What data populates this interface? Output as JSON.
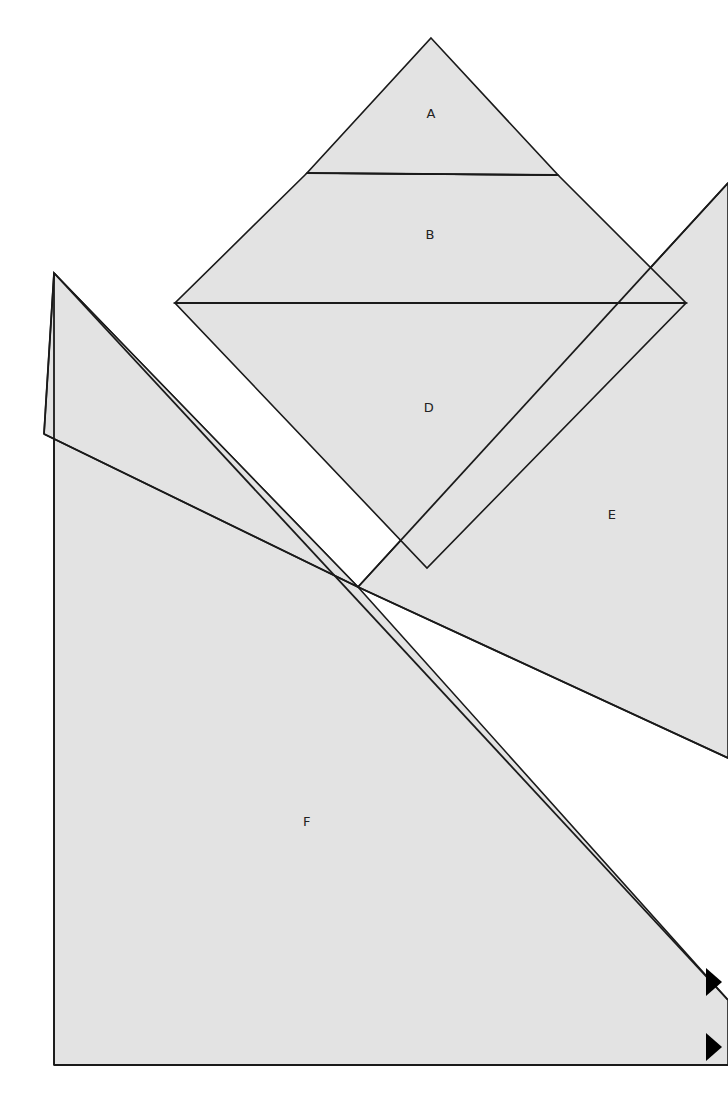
{
  "figure": {
    "canvas": {
      "width": 728,
      "height": 1119
    },
    "style": {
      "background_color": "#ffffff",
      "fill_color": "#e3e3e3",
      "stroke_color": "#1a1a1a",
      "marker_color": "#000000",
      "label_color": "#222222",
      "stroke_width": 1.6
    }
  },
  "regions": [
    {
      "id": "A",
      "label": "A",
      "label_x": 431,
      "label_y": 114,
      "description": "upper triangular cap of the large diamond",
      "points": "431,38 558,175 307,173"
    },
    {
      "id": "B",
      "label": "B",
      "label_x": 430,
      "label_y": 235,
      "description": "middle band of the large diamond",
      "points": "307,173 558,175 686,303 175,303"
    },
    {
      "id": "D",
      "label": "D",
      "label_x": 429,
      "label_y": 408,
      "description": "lower half of the large diamond",
      "points": "175,303 686,303 427,568"
    },
    {
      "id": "E",
      "label": "E",
      "label_x": 612,
      "label_y": 515,
      "description": "large right-hand wedge running off the right edge",
      "points": "728,183 728,758 358,587"
    },
    {
      "id": "F",
      "label": "F",
      "label_x": 307,
      "label_y": 822,
      "description": "large left-hand polygon occupying the lower left",
      "points": "54,273 358,587 728,1000 728,1065 54,1065"
    },
    {
      "id": "G",
      "label": "",
      "label_x": 0,
      "label_y": 0,
      "description": "narrow sliver between region F left vertex and the crossing point",
      "points": "44,434 358,587 54,273"
    }
  ],
  "dividers": [
    {
      "id": "divider-ab",
      "description": "line separating region A from region B",
      "x1": 307,
      "y1": 173,
      "x2": 558,
      "y2": 175
    },
    {
      "id": "divider-bd",
      "description": "horizontal line separating region B from region D",
      "x1": 175,
      "y1": 303,
      "x2": 686,
      "y2": 303
    },
    {
      "id": "divider-e-upper",
      "description": "upper edge of region E crossing the diamond",
      "x1": 728,
      "y1": 183,
      "x2": 358,
      "y2": 587
    },
    {
      "id": "divider-e-lower",
      "description": "lower edge of region E from the crossing point",
      "x1": 358,
      "y1": 587,
      "x2": 728,
      "y2": 758
    },
    {
      "id": "divider-f-left-upper",
      "description": "edge from F top-left corner down to the sliver vertex",
      "x1": 54,
      "y1": 273,
      "x2": 44,
      "y2": 434
    },
    {
      "id": "divider-f-sliver-top",
      "description": "upper sliver edge from left vertex to crossing point",
      "x1": 44,
      "y1": 434,
      "x2": 358,
      "y2": 587
    },
    {
      "id": "divider-f-diagonal",
      "description": "long diagonal of region F from top-left to lower right",
      "x1": 54,
      "y1": 273,
      "x2": 728,
      "y2": 1000
    },
    {
      "id": "divider-f-left-edge",
      "description": "vertical left edge of region F",
      "x1": 54,
      "y1": 273,
      "x2": 54,
      "y2": 1065
    },
    {
      "id": "divider-f-bottom",
      "description": "bottom edge of region F",
      "x1": 54,
      "y1": 1065,
      "x2": 728,
      "y2": 1065
    }
  ],
  "markers": [
    {
      "id": "arrow-upper",
      "name": "right-pointing-arrowhead",
      "points": "706,968 722,982 706,996"
    },
    {
      "id": "arrow-lower",
      "name": "right-pointing-arrowhead",
      "points": "706,1033 722,1047 706,1061"
    }
  ]
}
